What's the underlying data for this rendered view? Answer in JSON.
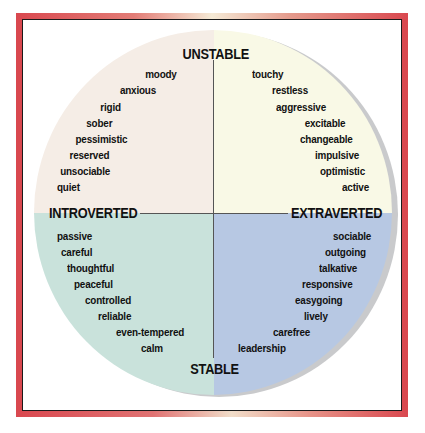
{
  "diagram": {
    "type": "personality-circle",
    "colors": {
      "frame": "#d9484f",
      "unstable_introverted": "#f5ede6",
      "unstable_extraverted": "#f9f9e6",
      "stable_introverted": "#c9e2db",
      "stable_extraverted": "#b7c8e3"
    },
    "axes": {
      "top": "UNSTABLE",
      "bottom": "STABLE",
      "left": "INTROVERTED",
      "right": "EXTRAVERTED"
    },
    "quadrants": {
      "unstable_introverted": [
        "moody",
        "anxious",
        "rigid",
        "sober",
        "pessimistic",
        "reserved",
        "unsociable",
        "quiet"
      ],
      "unstable_extraverted": [
        "touchy",
        "restless",
        "aggressive",
        "excitable",
        "changeable",
        "impulsive",
        "optimistic",
        "active"
      ],
      "stable_introverted": [
        "passive",
        "careful",
        "thoughtful",
        "peaceful",
        "controlled",
        "reliable",
        "even-tempered",
        "calm"
      ],
      "stable_extraverted": [
        "sociable",
        "outgoing",
        "talkative",
        "responsive",
        "easygoing",
        "lively",
        "carefree",
        "leadership"
      ]
    }
  }
}
